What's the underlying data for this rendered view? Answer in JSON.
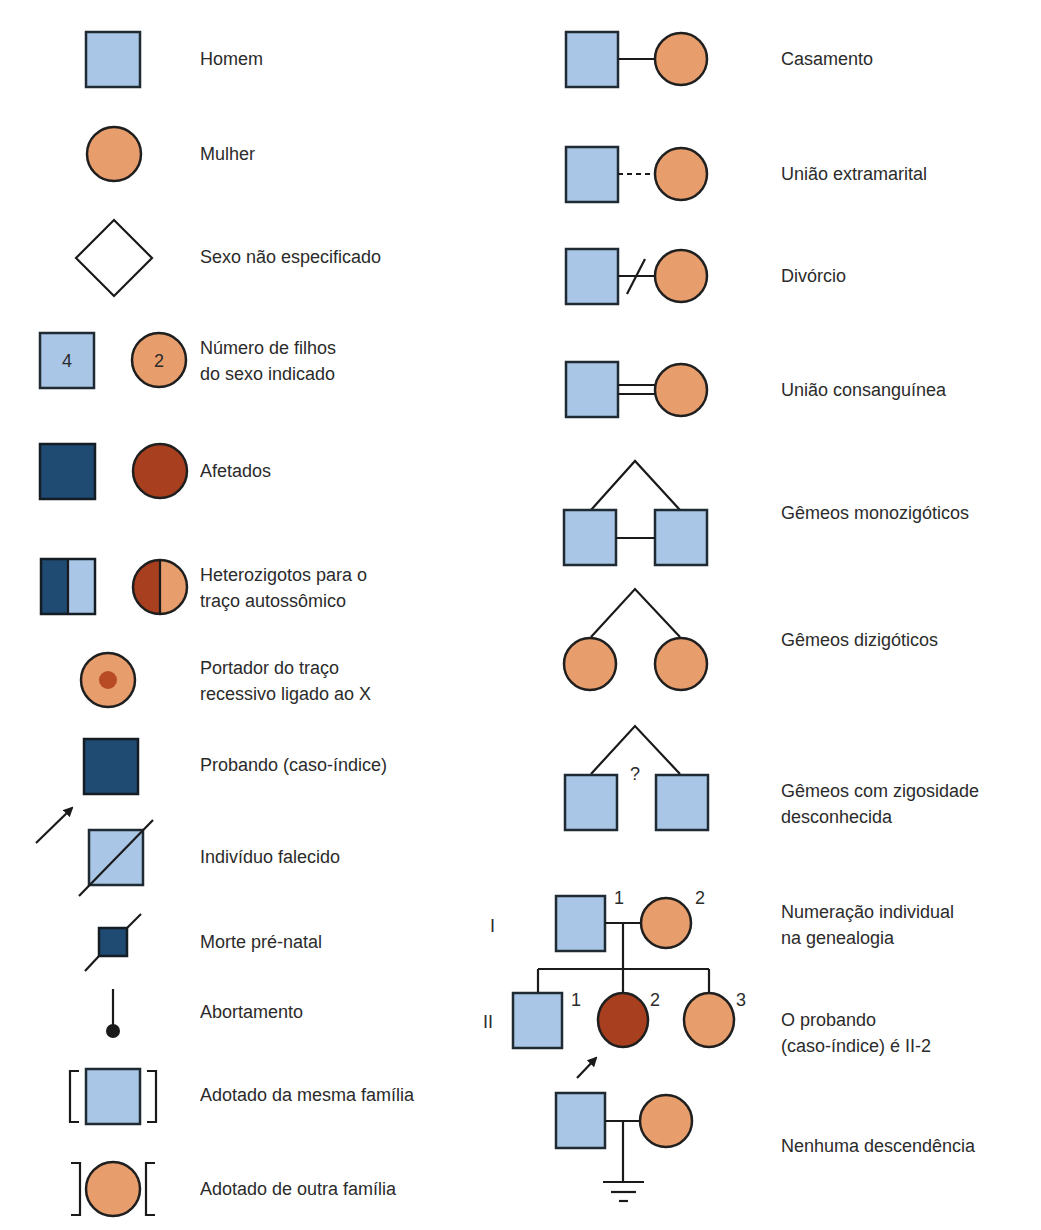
{
  "colors": {
    "male": "#a9c6e6",
    "female": "#e89d6c",
    "male_affected": "#1f4a72",
    "female_affected": "#a8401f",
    "stroke": "#1a1a1a"
  },
  "left_column": [
    {
      "id": "homem",
      "lines": [
        "Homem"
      ]
    },
    {
      "id": "mulher",
      "lines": [
        "Mulher"
      ]
    },
    {
      "id": "sexo",
      "lines": [
        "Sexo não especificado"
      ]
    },
    {
      "id": "numero",
      "lines": [
        "Número de filhos",
        "do sexo indicado"
      ],
      "male_count": "4",
      "female_count": "2"
    },
    {
      "id": "afetados",
      "lines": [
        "Afetados"
      ]
    },
    {
      "id": "hetero",
      "lines": [
        "Heterozigotos para o",
        "traço autossômico"
      ]
    },
    {
      "id": "portador",
      "lines": [
        "Portador do traço",
        "recessivo ligado ao X"
      ]
    },
    {
      "id": "probando",
      "lines": [
        "Probando (caso-índice)"
      ]
    },
    {
      "id": "falecido",
      "lines": [
        "Indivíduo falecido"
      ]
    },
    {
      "id": "morte",
      "lines": [
        "Morte pré-natal"
      ]
    },
    {
      "id": "aborto",
      "lines": [
        "Abortamento"
      ]
    },
    {
      "id": "adot_mesma",
      "lines": [
        "Adotado da mesma família"
      ]
    },
    {
      "id": "adot_outra",
      "lines": [
        "Adotado de outra família"
      ]
    }
  ],
  "right_column": [
    {
      "id": "casamento",
      "lines": [
        "Casamento"
      ]
    },
    {
      "id": "extramarital",
      "lines": [
        "União extramarital"
      ]
    },
    {
      "id": "divorcio",
      "lines": [
        "Divórcio"
      ]
    },
    {
      "id": "consanguinea",
      "lines": [
        "União consanguínea"
      ]
    },
    {
      "id": "mono",
      "lines": [
        "Gêmeos monozigóticos"
      ]
    },
    {
      "id": "dizi",
      "lines": [
        "Gêmeos dizigóticos"
      ]
    },
    {
      "id": "desconhecida",
      "lines": [
        "Gêmeos com zigosidade",
        "desconhecida"
      ],
      "mark": "?"
    },
    {
      "id": "numeracao",
      "lines": [
        "Numeração individual",
        "na genealogia"
      ]
    },
    {
      "id": "probando_ii2",
      "lines": [
        "O probando",
        "(caso-índice) é II-2"
      ]
    },
    {
      "id": "nenhuma",
      "lines": [
        "Nenhuma descendência"
      ]
    }
  ],
  "pedigree": {
    "generations": [
      "I",
      "II"
    ],
    "gen1_numbers": [
      "1",
      "2"
    ],
    "gen2_numbers": [
      "1",
      "2",
      "3"
    ]
  }
}
